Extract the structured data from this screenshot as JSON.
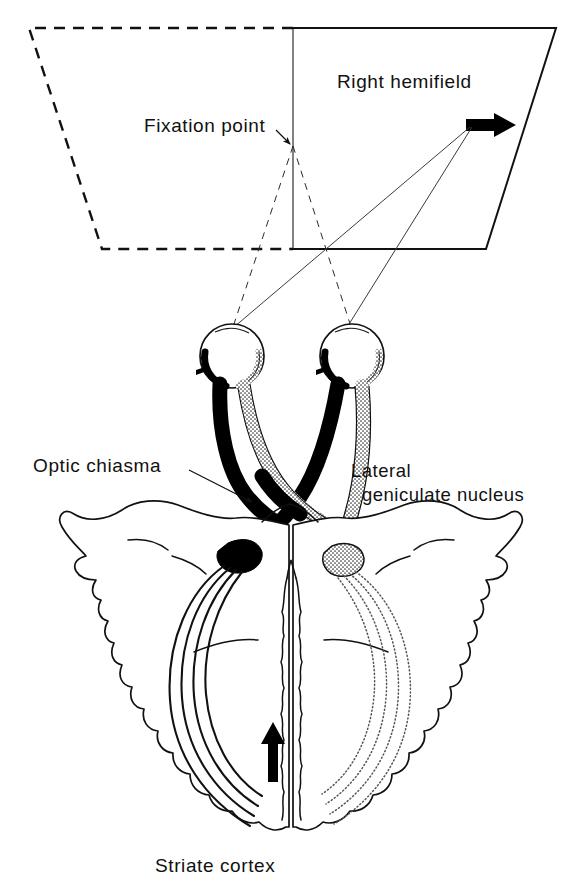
{
  "figure": {
    "title_implicit": "Visual pathway from hemifield to striate cortex",
    "labels": {
      "right_hemifield": "Right hemifield",
      "fixation_point": "Fixation point",
      "optic_chiasma": "Optic chiasma",
      "lateral_geniculate_line1": "Lateral",
      "lateral_geniculate_line2": "geniculate nucleus",
      "striate_cortex": "Striate cortex"
    },
    "icons": {
      "target_arrow": "right-pointing-arrow-icon",
      "cortex_arrow": "up-pointing-arrow-icon",
      "left_eye_rotation_arrow": "left-pointing-small-arrow-icon",
      "right_eye_rotation_arrow": "left-pointing-small-arrow-icon",
      "fixation_leader": "leader-line-arrow-icon",
      "chiasma_leader": "leader-line-arrow-icon",
      "lgn_leader": "leader-line-arrow-icon"
    },
    "colors": {
      "ink": "#111111",
      "paper": "#ffffff",
      "crossed_tract": "#000000",
      "uncrossed_tract": "#ffffff"
    },
    "parts": {
      "visual_field_plane": "visual-field-plane",
      "left_hemifield_region": "left-hemifield-dashed-region",
      "right_hemifield_region": "right-hemifield-solid-region",
      "left_eye": "left-eye",
      "right_eye": "right-eye",
      "optic_nerve_left": "left-optic-nerve",
      "optic_nerve_right": "right-optic-nerve",
      "chiasma": "optic-chiasma-crossing",
      "optic_tract_left": "left-optic-tract",
      "optic_tract_right": "right-optic-tract",
      "lgn_left": "left-lateral-geniculate-nucleus",
      "lgn_right": "right-lateral-geniculate-nucleus",
      "optic_radiation_left": "left-optic-radiation",
      "optic_radiation_right": "right-optic-radiation",
      "brain": "brain-cortex-outline",
      "midline": "interhemispheric-midline"
    }
  }
}
